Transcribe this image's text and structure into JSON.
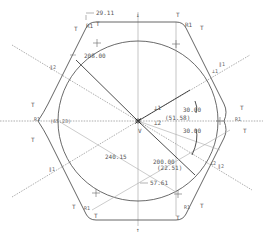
{
  "drawing": {
    "type": "hexagonal-part-sketch",
    "colors": {
      "outline": "#555555",
      "circle": "#444444",
      "centerline": "#777777",
      "dimension": "#666666",
      "text": "#555555"
    },
    "dimensions": {
      "top_chamfer": "29.11",
      "radius": "208.00",
      "vertical_upper": "30.00",
      "vertical_lower": "30.00",
      "horizontal_center": "(51.58)",
      "lower_diag": "240.15",
      "lower_radius": "200.00",
      "lower_offset": "(22.51)",
      "lower_left": "57.61",
      "left_ref": "(65.23)"
    },
    "constraints": {
      "tangent": "T",
      "vertical": "V",
      "perpendicular_1": "⊥1",
      "perpendicular_2": "⊥2",
      "fillet_r1": "R1",
      "parallel_1": "∥1",
      "parallel_2": "∥2"
    },
    "axis_marks": {
      "top": "↓",
      "bottom": "↑"
    }
  }
}
